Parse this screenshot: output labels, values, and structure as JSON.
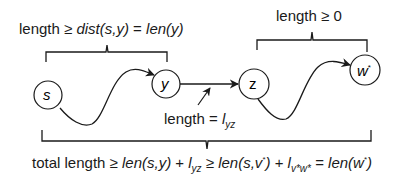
{
  "diagram": {
    "nodes": [
      {
        "id": "s",
        "label": "s",
        "cx": 48,
        "cy": 95,
        "r": 14
      },
      {
        "id": "y",
        "label": "y",
        "cx": 166,
        "cy": 84,
        "r": 14
      },
      {
        "id": "z",
        "label": "z",
        "cx": 254,
        "cy": 84,
        "r": 15
      },
      {
        "id": "w_star",
        "label": "w",
        "label_sup": "*",
        "cx": 365,
        "cy": 70,
        "r": 15
      }
    ],
    "edges": [
      {
        "from": "s",
        "to": "y",
        "style": "wavy-path"
      },
      {
        "from": "y",
        "to": "z",
        "style": "straight-arrow"
      },
      {
        "from": "z",
        "to": "w_star",
        "style": "wavy-path"
      }
    ],
    "labels": {
      "top_left": {
        "prefix": "length ≥ ",
        "dist": "dist(s,y)",
        "eq": " = ",
        "len": "len(y)"
      },
      "top_right": {
        "text": "length ≥ 0"
      },
      "middle": {
        "prefix": "length = ",
        "l": "l",
        "sub": "yz"
      },
      "bottom": {
        "prefix": "total length ≥ ",
        "len_sy": "len(s,y)",
        "plus1": " + ",
        "l1": "l",
        "l1_sub": "yz",
        "geq": " ≥ ",
        "len_sv": "len(s,v",
        "len_sv_sup": "*",
        "len_sv_close": ")",
        "plus2": " + ",
        "l2": "l",
        "l2_sub": "v*w*",
        "eq": " = ",
        "len_w": "len(w",
        "len_w_sup": "*",
        "len_w_close": ")"
      }
    },
    "colors": {
      "stroke": "#1a1a1a",
      "background": "#ffffff"
    }
  }
}
